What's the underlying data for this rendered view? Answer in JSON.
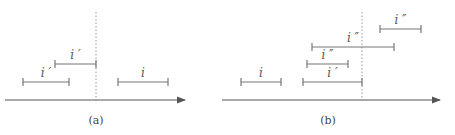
{
  "panels": [
    {
      "caption": "(a)",
      "axis": {
        "x1": 5,
        "x2": 185,
        "y": 100
      },
      "divider_x": 96,
      "intervals": [
        {
          "label": "i ′",
          "x1": 55,
          "x2": 96,
          "y": 64
        },
        {
          "label": "i ′",
          "x1": 23,
          "x2": 69,
          "y": 82
        },
        {
          "label": "i",
          "x1": 118,
          "x2": 168,
          "y": 82
        }
      ]
    },
    {
      "caption": "(b)",
      "axis": {
        "x1": 222,
        "x2": 440,
        "y": 100
      },
      "divider_x": 362,
      "intervals": [
        {
          "label": "i",
          "x1": 241,
          "x2": 281,
          "y": 82
        },
        {
          "label": "i ′",
          "x1": 303,
          "x2": 362,
          "y": 82
        },
        {
          "label": "i ″",
          "x1": 307,
          "x2": 348,
          "y": 64
        },
        {
          "label": "i ″",
          "x1": 312,
          "x2": 394,
          "y": 47
        },
        {
          "label": "i ″",
          "x1": 380,
          "x2": 421,
          "y": 29
        }
      ]
    }
  ],
  "colors": {
    "line": "#777777",
    "axis": "#555555",
    "dotted": "#999999"
  }
}
